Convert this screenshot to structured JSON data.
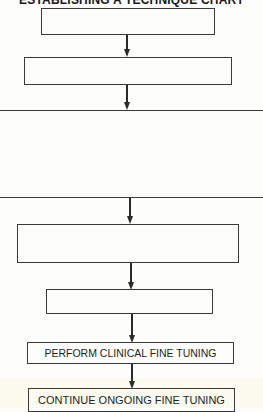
{
  "diagram": {
    "title": "ESTABLISHING A TECHNIQUE CHART",
    "line_color": "#3a3a3a",
    "background": "#fdfdfb",
    "nodes": [
      {
        "id": "step-1",
        "label": ""
      },
      {
        "id": "step-2",
        "label": ""
      },
      {
        "id": "section-block",
        "label": ""
      },
      {
        "id": "step-3",
        "label": ""
      },
      {
        "id": "step-4",
        "label": ""
      },
      {
        "id": "step-5",
        "label": "PERFORM CLINICAL FINE TUNING"
      },
      {
        "id": "step-6",
        "label": "CONTINUE ONGOING FINE TUNING"
      }
    ],
    "edges": [
      {
        "from": "step-1",
        "to": "step-2"
      },
      {
        "from": "step-2",
        "to": "section-block"
      },
      {
        "from": "section-block",
        "to": "step-3"
      },
      {
        "from": "step-3",
        "to": "step-4"
      },
      {
        "from": "step-4",
        "to": "step-5"
      },
      {
        "from": "step-5",
        "to": "step-6"
      }
    ]
  }
}
